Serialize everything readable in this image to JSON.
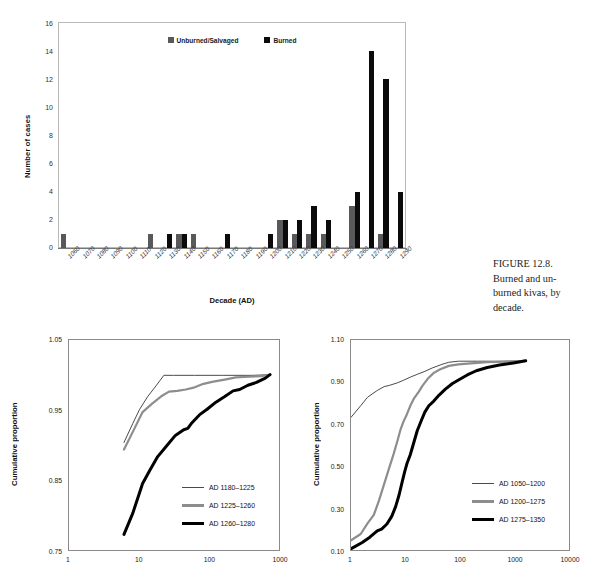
{
  "figure": {
    "caption": "FIGURE 12.8. Burned and un-burned kivas, by decade.",
    "caption_lines": [
      "FIGURE 12.8.",
      "Burned and un-",
      "burned kivas, by",
      "decade."
    ]
  },
  "colors": {
    "gray_series": "#59595b",
    "black_series": "#0b0b0b",
    "axis": "#8a8a8a",
    "background": "#ffffff"
  },
  "chart_data": [
    {
      "id": "burned-unburned-kivas-by-decade",
      "type": "bar",
      "title": "",
      "xlabel": "Decade (AD)",
      "ylabel": "Number of cases",
      "ylim": [
        0,
        16
      ],
      "yticks": [
        0,
        2,
        4,
        6,
        8,
        10,
        12,
        14,
        16
      ],
      "grid": false,
      "legend_position": "top-center",
      "categories": [
        "1060",
        "1070",
        "1080",
        "1090",
        "1100",
        "1110",
        "1120",
        "1130",
        "1140",
        "1150",
        "1160",
        "1170",
        "1180",
        "1190",
        "1200",
        "1210",
        "1220",
        "1230",
        "1240",
        "1250",
        "1260",
        "1270",
        "1280",
        "1290"
      ],
      "series": [
        {
          "name": "Unburned/Salvaged",
          "color": "#59595b",
          "values": [
            1,
            0,
            0,
            0,
            0,
            0,
            1,
            0,
            1,
            1,
            0,
            0,
            0,
            0,
            0,
            2,
            1,
            1,
            1,
            0,
            3,
            0,
            1,
            0
          ]
        },
        {
          "name": "Burned",
          "color": "#0b0b0b",
          "values": [
            0,
            0,
            0,
            0,
            0,
            0,
            0,
            1,
            1,
            0,
            0,
            1,
            0,
            0,
            1,
            2,
            2,
            3,
            2,
            0,
            4,
            14,
            12,
            4
          ]
        }
      ]
    },
    {
      "id": "cumulative-proportion-left",
      "type": "line",
      "title": "",
      "xlabel": "",
      "ylabel": "Cumulative proportion",
      "xscale": "log",
      "xlim": [
        1,
        1000
      ],
      "xticks": [
        1,
        10,
        100,
        1000
      ],
      "ylim": [
        0.75,
        1.05
      ],
      "yticks": [
        0.75,
        0.85,
        0.95,
        1.05
      ],
      "ytick_labels": [
        "0.75",
        "0.85",
        "0.95",
        "1.05"
      ],
      "grid": false,
      "legend_position": "lower-right",
      "series": [
        {
          "name": "AD 1180–1225",
          "color": "#4a4a4a",
          "width": 1,
          "points": [
            [
              6,
              0.905
            ],
            [
              8,
              0.932
            ],
            [
              10,
              0.952
            ],
            [
              13,
              0.97
            ],
            [
              17,
              0.985
            ],
            [
              22,
              1.0
            ],
            [
              30,
              1.0
            ],
            [
              60,
              1.0
            ],
            [
              150,
              1.0
            ],
            [
              400,
              1.0
            ],
            [
              700,
              1.001
            ]
          ]
        },
        {
          "name": "AD 1225–1260",
          "color": "#8d8d8d",
          "width": 2.2,
          "points": [
            [
              6,
              0.895
            ],
            [
              8,
              0.92
            ],
            [
              11,
              0.948
            ],
            [
              15,
              0.96
            ],
            [
              20,
              0.97
            ],
            [
              26,
              0.977
            ],
            [
              34,
              0.978
            ],
            [
              45,
              0.98
            ],
            [
              60,
              0.983
            ],
            [
              80,
              0.988
            ],
            [
              110,
              0.991
            ],
            [
              160,
              0.994
            ],
            [
              230,
              0.997
            ],
            [
              350,
              0.998
            ],
            [
              520,
              0.999
            ],
            [
              700,
              1.001
            ]
          ]
        },
        {
          "name": "AD 1260–1280",
          "color": "#000000",
          "width": 3,
          "points": [
            [
              6,
              0.775
            ],
            [
              8,
              0.805
            ],
            [
              11,
              0.847
            ],
            [
              14,
              0.866
            ],
            [
              18,
              0.885
            ],
            [
              24,
              0.9
            ],
            [
              32,
              0.915
            ],
            [
              42,
              0.923
            ],
            [
              48,
              0.925
            ],
            [
              55,
              0.933
            ],
            [
              70,
              0.944
            ],
            [
              90,
              0.952
            ],
            [
              120,
              0.962
            ],
            [
              160,
              0.97
            ],
            [
              210,
              0.978
            ],
            [
              260,
              0.98
            ],
            [
              340,
              0.986
            ],
            [
              450,
              0.99
            ],
            [
              600,
              0.996
            ],
            [
              700,
              1.001
            ]
          ]
        }
      ]
    },
    {
      "id": "cumulative-proportion-right",
      "type": "line",
      "title": "",
      "xlabel": "",
      "ylabel": "Cumulative proportion",
      "xscale": "log",
      "xlim": [
        1,
        10000
      ],
      "xticks": [
        1,
        10,
        100,
        1000,
        10000
      ],
      "ylim": [
        0.1,
        1.1
      ],
      "yticks": [
        0.1,
        0.3,
        0.5,
        0.7,
        0.9,
        1.1
      ],
      "ytick_labels": [
        "0.10",
        "0.30",
        "0.50",
        "0.70",
        "0.90",
        "1.10"
      ],
      "grid": false,
      "legend_position": "lower-right",
      "series": [
        {
          "name": "AD  1050–1200",
          "color": "#4a4a4a",
          "width": 1,
          "points": [
            [
              1,
              0.735
            ],
            [
              1.5,
              0.79
            ],
            [
              2,
              0.83
            ],
            [
              3,
              0.862
            ],
            [
              4,
              0.88
            ],
            [
              5,
              0.886
            ],
            [
              7,
              0.898
            ],
            [
              9,
              0.91
            ],
            [
              12,
              0.925
            ],
            [
              16,
              0.938
            ],
            [
              22,
              0.952
            ],
            [
              30,
              0.968
            ],
            [
              45,
              0.985
            ],
            [
              60,
              0.995
            ],
            [
              90,
              1.0
            ],
            [
              200,
              1.0
            ],
            [
              600,
              1.0
            ],
            [
              1500,
              1.002
            ]
          ]
        },
        {
          "name": "AD  1200–1275",
          "color": "#8d8d8d",
          "width": 2.2,
          "points": [
            [
              1,
              0.155
            ],
            [
              1.5,
              0.185
            ],
            [
              2,
              0.235
            ],
            [
              2.6,
              0.275
            ],
            [
              3.2,
              0.34
            ],
            [
              4,
              0.42
            ],
            [
              5,
              0.5
            ],
            [
              6,
              0.565
            ],
            [
              7,
              0.625
            ],
            [
              8,
              0.68
            ],
            [
              9,
              0.715
            ],
            [
              10,
              0.74
            ],
            [
              12,
              0.79
            ],
            [
              14,
              0.825
            ],
            [
              17,
              0.855
            ],
            [
              20,
              0.885
            ],
            [
              25,
              0.918
            ],
            [
              32,
              0.945
            ],
            [
              42,
              0.962
            ],
            [
              60,
              0.978
            ],
            [
              90,
              0.985
            ],
            [
              150,
              0.99
            ],
            [
              300,
              0.995
            ],
            [
              700,
              0.998
            ],
            [
              1500,
              1.002
            ]
          ]
        },
        {
          "name": "AD  1275–1350",
          "color": "#000000",
          "width": 3,
          "points": [
            [
              1,
              0.115
            ],
            [
              1.6,
              0.145
            ],
            [
              2.2,
              0.17
            ],
            [
              3,
              0.2
            ],
            [
              3.6,
              0.208
            ],
            [
              4.5,
              0.232
            ],
            [
              5.5,
              0.268
            ],
            [
              6.5,
              0.315
            ],
            [
              7.5,
              0.37
            ],
            [
              8.5,
              0.43
            ],
            [
              9.5,
              0.48
            ],
            [
              10.5,
              0.52
            ],
            [
              12,
              0.56
            ],
            [
              14,
              0.62
            ],
            [
              16,
              0.672
            ],
            [
              19,
              0.72
            ],
            [
              22,
              0.76
            ],
            [
              26,
              0.79
            ],
            [
              32,
              0.812
            ],
            [
              40,
              0.84
            ],
            [
              52,
              0.868
            ],
            [
              70,
              0.895
            ],
            [
              95,
              0.915
            ],
            [
              130,
              0.935
            ],
            [
              190,
              0.955
            ],
            [
              300,
              0.97
            ],
            [
              500,
              0.982
            ],
            [
              900,
              0.992
            ],
            [
              1500,
              1.002
            ]
          ]
        }
      ]
    }
  ]
}
